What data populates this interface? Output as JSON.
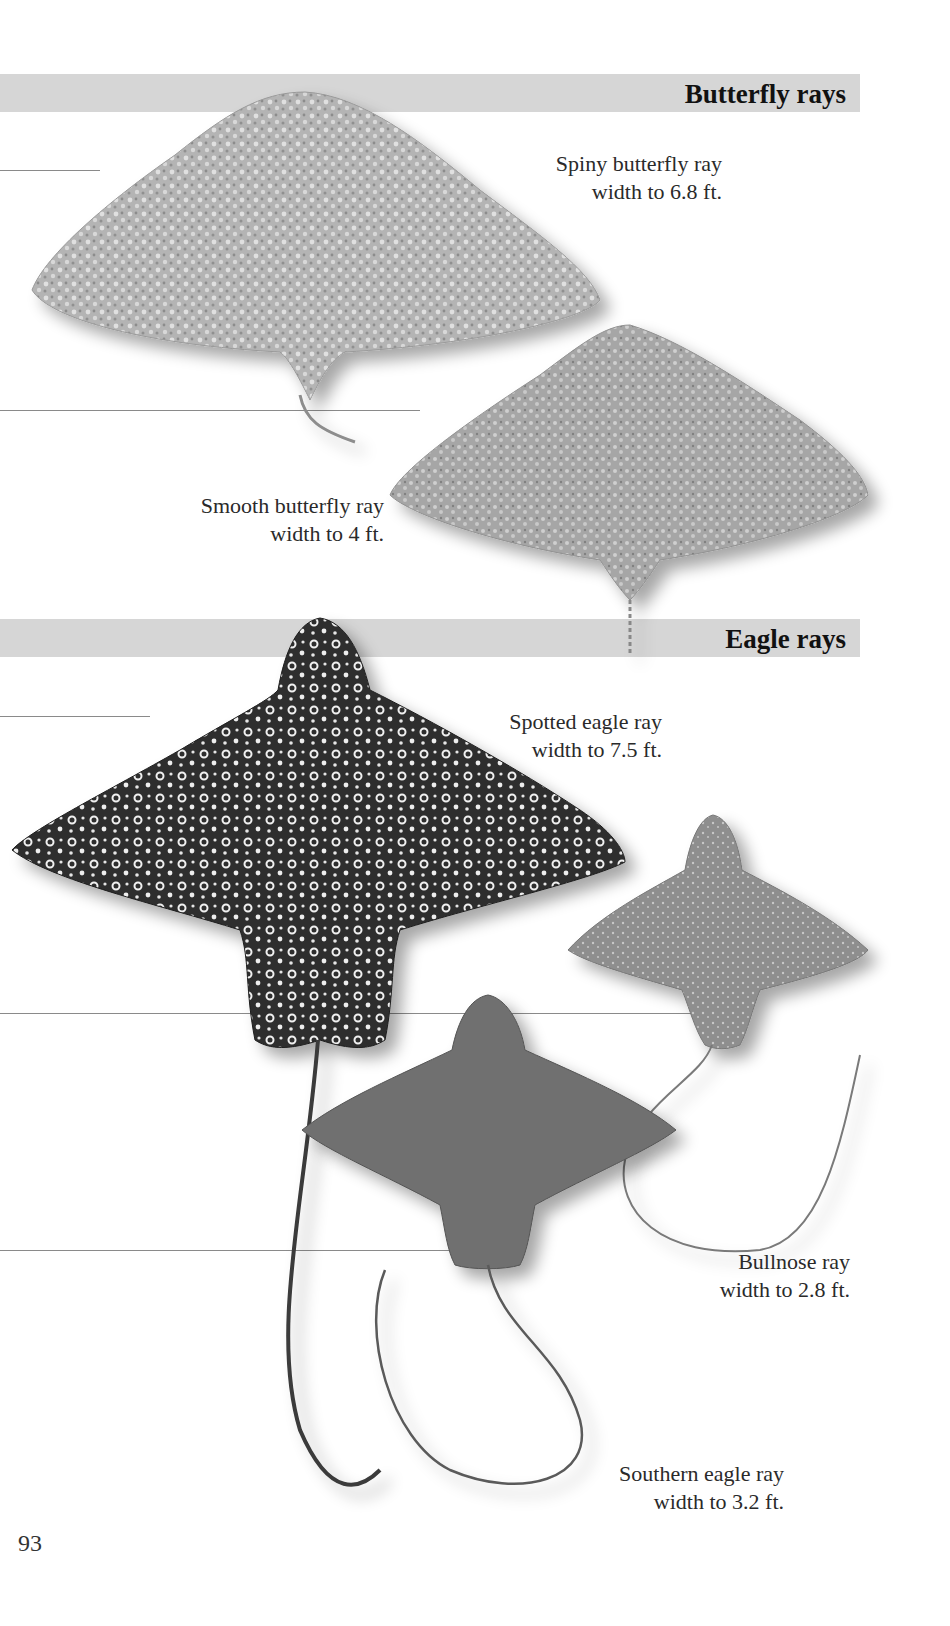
{
  "page": {
    "number": "93",
    "sections": [
      {
        "title": "Butterfly rays",
        "species": [
          {
            "name": "Spiny butterfly ray",
            "size": "width to 6.8 ft."
          },
          {
            "name": "Smooth butterfly ray",
            "size": "width to 4 ft."
          }
        ]
      },
      {
        "title": "Eagle rays",
        "species": [
          {
            "name": "Spotted eagle ray",
            "size": "width to 7.5 ft."
          },
          {
            "name": "Bullnose ray",
            "size": "width to 2.8 ft."
          },
          {
            "name": "Southern eagle ray",
            "size": "width to 3.2 ft."
          }
        ]
      }
    ]
  },
  "colors": {
    "band": "#d6d6d6",
    "title_text": "#111111",
    "caption_text": "#2a2a2a",
    "guide_line": "#8a8a8a",
    "spiny_butterfly_ray": "#a9a9a9",
    "smooth_butterfly_ray": "#9d9d9d",
    "spotted_eagle_ray": "#2e2e2e",
    "bullnose_ray": "#8a8a8a",
    "southern_eagle_ray": "#6e6e6e"
  }
}
